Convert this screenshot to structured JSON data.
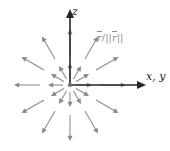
{
  "figure": {
    "background_color": "#ffffff",
    "width": 170,
    "height": 151
  },
  "axes": {
    "origin": {
      "x": 70,
      "y": 85
    },
    "color": "#262626",
    "vertical": {
      "name": "z-axis",
      "label": "z",
      "from": {
        "x": 70,
        "y": 85
      },
      "to": {
        "x": 70,
        "y": 9
      },
      "arrowhead": true
    },
    "horizontal": {
      "name": "x-y-axis",
      "label": "x, y",
      "from": {
        "x": 70,
        "y": 85
      },
      "to": {
        "x": 146,
        "y": 85
      },
      "arrowhead": true
    }
  },
  "field": {
    "name": "unit-radial-field",
    "label_parts": {
      "numerator": "r",
      "slash": "/",
      "norm_open": "||",
      "norm_vector": "r",
      "norm_close": "||"
    },
    "label_plain": "r / ||r||",
    "arrow_color": "#8a8a8a",
    "directions_deg": [
      0,
      30,
      60,
      90,
      120,
      150,
      180,
      210,
      240,
      270,
      300,
      330
    ],
    "rings": [
      {
        "name": "inner-ring",
        "start_radius": 7,
        "end_radius": 22
      },
      {
        "name": "outer-ring",
        "start_radius": 30,
        "end_radius": 56
      }
    ]
  },
  "chart_data": {
    "type": "scatter",
    "title": "",
    "xlabel": "x, y",
    "ylabel": "z",
    "grid": false,
    "legend": null,
    "annotations": [
      "r/||r||"
    ],
    "x": [
      0,
      30,
      60,
      90,
      120,
      150,
      180,
      210,
      240,
      270,
      300,
      330
    ],
    "series": [
      {
        "name": "inner-ring-magnitude",
        "values": [
          1,
          1,
          1,
          1,
          1,
          1,
          1,
          1,
          1,
          1,
          1,
          1
        ]
      },
      {
        "name": "outer-ring-magnitude",
        "values": [
          1,
          1,
          1,
          1,
          1,
          1,
          1,
          1,
          1,
          1,
          1,
          1
        ]
      }
    ]
  }
}
